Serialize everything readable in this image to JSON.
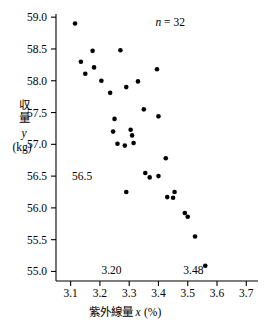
{
  "chart_data": {
    "type": "scatter",
    "title": "",
    "subtitle": "",
    "xlabel": "紫外線量 x (%)",
    "ylabel": "収量 y (kg)",
    "xlim": [
      3.05,
      3.74
    ],
    "ylim": [
      54.85,
      59.05
    ],
    "grid": false,
    "legend_position": "none",
    "xticks": [
      "3.1",
      "3.2",
      "3.3",
      "3.4",
      "3.5",
      "3.6",
      "3.7"
    ],
    "xtick_values": [
      3.1,
      3.2,
      3.3,
      3.4,
      3.5,
      3.6,
      3.7
    ],
    "yticks": [
      "55.0",
      "55.5",
      "56.0",
      "56.5",
      "57.0",
      "57.5",
      "58.0",
      "58.5",
      "59.0"
    ],
    "ytick_values": [
      55.0,
      55.5,
      56.0,
      56.5,
      57.0,
      57.5,
      58.0,
      58.5,
      59.0
    ],
    "annotations": [
      {
        "name": "sample-size",
        "text": "n = 32",
        "x": 3.44,
        "y": 58.92
      },
      {
        "name": "y-reference-56-5",
        "text": "56.5",
        "x": 3.105,
        "y": 56.5
      },
      {
        "name": "x-reference-3-20",
        "text": "3.20",
        "x": 3.205,
        "y": 55.02
      },
      {
        "name": "x-reference-3-48",
        "text": "3.48",
        "x": 3.485,
        "y": 55.02
      }
    ],
    "series": [
      {
        "name": "収量",
        "marker": "circle",
        "color": "#000000",
        "points": [
          [
            3.115,
            58.9
          ],
          [
            3.135,
            58.3
          ],
          [
            3.15,
            58.11
          ],
          [
            3.175,
            58.47
          ],
          [
            3.18,
            58.21
          ],
          [
            3.205,
            58.0
          ],
          [
            3.235,
            57.81
          ],
          [
            3.25,
            57.4
          ],
          [
            3.245,
            57.2
          ],
          [
            3.26,
            57.01
          ],
          [
            3.27,
            58.48
          ],
          [
            3.29,
            57.9
          ],
          [
            3.305,
            57.23
          ],
          [
            3.31,
            57.14
          ],
          [
            3.315,
            57.02
          ],
          [
            3.33,
            57.99
          ],
          [
            3.35,
            57.55
          ],
          [
            3.355,
            56.55
          ],
          [
            3.37,
            56.48
          ],
          [
            3.29,
            56.25
          ],
          [
            3.395,
            58.18
          ],
          [
            3.4,
            57.44
          ],
          [
            3.4,
            56.5
          ],
          [
            3.425,
            56.78
          ],
          [
            3.43,
            56.17
          ],
          [
            3.45,
            56.16
          ],
          [
            3.455,
            56.25
          ],
          [
            3.49,
            55.92
          ],
          [
            3.5,
            55.86
          ],
          [
            3.525,
            55.55
          ],
          [
            3.56,
            55.09
          ],
          [
            3.285,
            56.98
          ]
        ]
      }
    ]
  },
  "axis_titles": {
    "y_cjk_line1": "収",
    "y_cjk_line2": "量",
    "y_var": "y",
    "y_unit": "(kg)",
    "x_cjk": "紫外線量",
    "x_var": "x",
    "x_unit": "(%)"
  }
}
